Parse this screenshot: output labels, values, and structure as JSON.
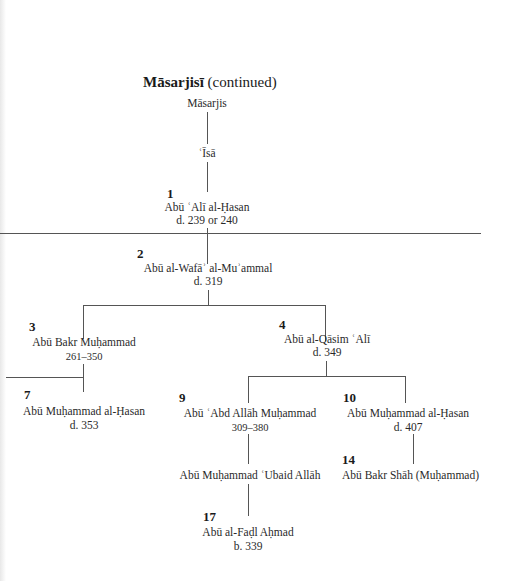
{
  "title": {
    "name": "Māsarjisī",
    "suffix": "(continued)"
  },
  "nodes": {
    "masarjis": {
      "name": "Māsarjis"
    },
    "isa": {
      "name": "ʿĪsā"
    },
    "n1": {
      "number": "1",
      "name": "Abū ʿAlī al-Ḥasan",
      "dates": "d. 239 or 240"
    },
    "n2": {
      "number": "2",
      "name": "Abū al-Wafāʾ al-Muʾammal",
      "dates": "d. 319"
    },
    "n3": {
      "number": "3",
      "name": "Abū Bakr Muḥammad",
      "dates": "261–350"
    },
    "n4": {
      "number": "4",
      "name": "Abū al-Qāsim ʿAlī",
      "dates": "d. 349"
    },
    "n7": {
      "number": "7",
      "name": "Abū Muḥammad al-Ḥasan",
      "dates": "d. 353"
    },
    "n9": {
      "number": "9",
      "name": "Abū ʿAbd Allāh Muḥammad",
      "dates": "309–380"
    },
    "n10": {
      "number": "10",
      "name": "Abū Muḥammad al-Ḥasan",
      "dates": "d. 407"
    },
    "ubaid": {
      "name": "Abū Muḥammad ʿUbaid Allāh"
    },
    "n14": {
      "number": "14",
      "name": "Abū Bakr Shāh (Muḥammad)"
    },
    "n17": {
      "number": "17",
      "name": "Abū al-Faḍl Aḥmad",
      "dates": "b. 339"
    }
  }
}
